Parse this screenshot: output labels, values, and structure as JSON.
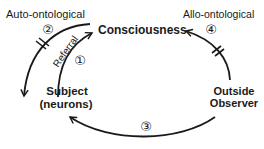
{
  "diagram": {
    "labels": {
      "auto": "Auto-ontological",
      "allo": "Allo-ontological",
      "consciousness": "Consciousness",
      "subject_line1": "Subject",
      "subject_line2": "(neurons)",
      "observer_line1": "Outside",
      "observer_line2": "Observer",
      "referral": "Referral"
    },
    "markers": {
      "one": "①",
      "two": "②",
      "three": "③",
      "four": "④"
    },
    "colors": {
      "stroke": "#1a1a1a",
      "background": "#ffffff"
    }
  }
}
